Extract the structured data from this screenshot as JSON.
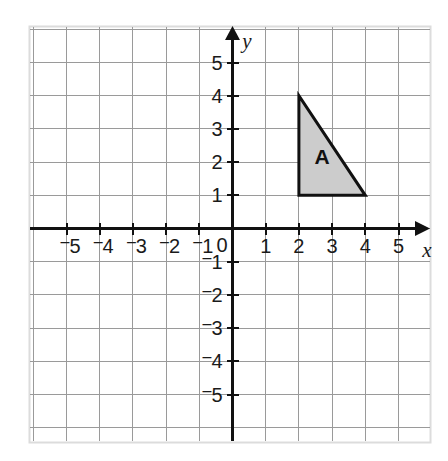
{
  "chart_data": {
    "type": "scatter",
    "title": "",
    "xlabel": "x",
    "ylabel": "y",
    "xlim": [
      -5.7,
      5.7
    ],
    "ylim": [
      -5.7,
      5.7
    ],
    "grid": true,
    "legend": "none",
    "x_ticks": [
      "-5",
      "-4",
      "-3",
      "-2",
      "-1",
      "0",
      "1",
      "2",
      "3",
      "4",
      "5"
    ],
    "x_tick_values": [
      -5,
      -4,
      -3,
      -2,
      -1,
      0,
      1,
      2,
      3,
      4,
      5
    ],
    "y_ticks": [
      "5",
      "4",
      "3",
      "2",
      "1",
      "-1",
      "-2",
      "-3",
      "-4",
      "-5"
    ],
    "y_tick_values": [
      5,
      4,
      3,
      2,
      1,
      -1,
      -2,
      -3,
      -4,
      -5
    ],
    "origin_label": "0",
    "shapes": [
      {
        "name": "A",
        "type": "triangle",
        "vertices": [
          [
            2,
            4
          ],
          [
            2,
            1
          ],
          [
            4,
            1
          ]
        ],
        "label": "A",
        "label_position": [
          2.7,
          2.1
        ],
        "fill": "#cccccc",
        "stroke": "#111111"
      }
    ],
    "colors": {
      "grid": "#9a9a9a",
      "axis": "#111111",
      "background": "#ffffff",
      "border": "#d8d8d8",
      "shape_fill": "#cccccc",
      "shape_stroke": "#111111"
    }
  },
  "axes": {
    "x_label": "x",
    "y_label": "y",
    "origin": "0",
    "x_tick_labels": [
      {
        "text": "-5",
        "display": "5",
        "negative": true,
        "value": -5
      },
      {
        "text": "-4",
        "display": "4",
        "negative": true,
        "value": -4
      },
      {
        "text": "-3",
        "display": "3",
        "negative": true,
        "value": -3
      },
      {
        "text": "-2",
        "display": "2",
        "negative": true,
        "value": -2
      },
      {
        "text": "-1",
        "display": "1",
        "negative": true,
        "value": -1
      },
      {
        "text": "1",
        "display": "1",
        "negative": false,
        "value": 1
      },
      {
        "text": "2",
        "display": "2",
        "negative": false,
        "value": 2
      },
      {
        "text": "3",
        "display": "3",
        "negative": false,
        "value": 3
      },
      {
        "text": "4",
        "display": "4",
        "negative": false,
        "value": 4
      },
      {
        "text": "5",
        "display": "5",
        "negative": false,
        "value": 5
      }
    ],
    "y_tick_labels": [
      {
        "text": "5",
        "display": "5",
        "negative": false,
        "value": 5
      },
      {
        "text": "4",
        "display": "4",
        "negative": false,
        "value": 4
      },
      {
        "text": "3",
        "display": "3",
        "negative": false,
        "value": 3
      },
      {
        "text": "2",
        "display": "2",
        "negative": false,
        "value": 2
      },
      {
        "text": "1",
        "display": "1",
        "negative": false,
        "value": 1
      },
      {
        "text": "-1",
        "display": "1",
        "negative": true,
        "value": -1
      },
      {
        "text": "-2",
        "display": "2",
        "negative": true,
        "value": -2
      },
      {
        "text": "-3",
        "display": "3",
        "negative": true,
        "value": -3
      },
      {
        "text": "-4",
        "display": "4",
        "negative": true,
        "value": -4
      },
      {
        "text": "-5",
        "display": "5",
        "negative": true,
        "value": -5
      }
    ]
  },
  "shape": {
    "label": "A"
  }
}
